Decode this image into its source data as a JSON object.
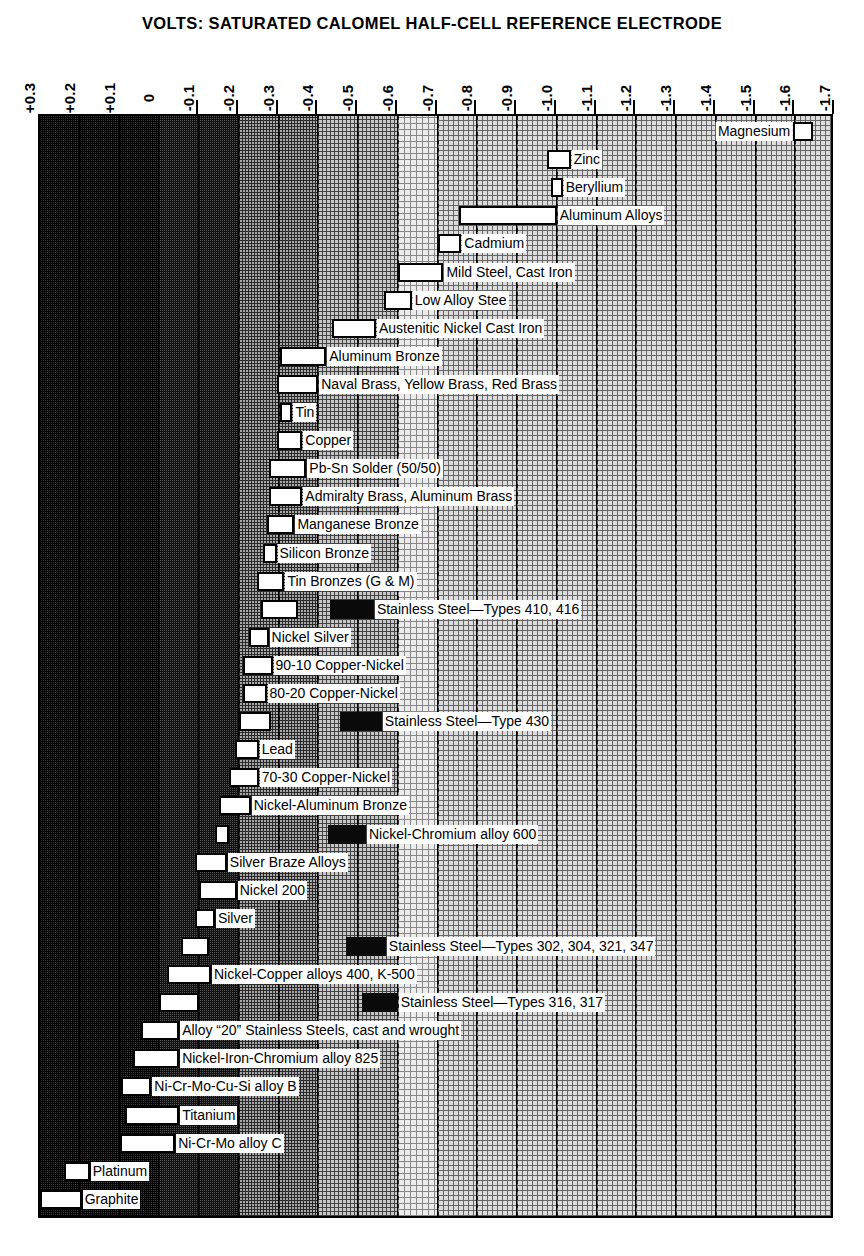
{
  "title": "VOLTS: SATURATED CALOMEL HALF-CELL REFERENCE ELECTRODE",
  "axis": {
    "ticks": [
      {
        "label": "+0.3",
        "value": 0.3,
        "mark": false
      },
      {
        "label": "+0.2",
        "value": 0.2,
        "mark": false
      },
      {
        "label": "+0.1",
        "value": 0.1,
        "mark": false
      },
      {
        "label": "0",
        "value": 0.0,
        "mark": false
      },
      {
        "label": "-0.1",
        "value": -0.1,
        "mark": true
      },
      {
        "label": "-0.2",
        "value": -0.2,
        "mark": true
      },
      {
        "label": "-0.3",
        "value": -0.3,
        "mark": true
      },
      {
        "label": "-0.4",
        "value": -0.4,
        "mark": true
      },
      {
        "label": "-0.5",
        "value": -0.5,
        "mark": true
      },
      {
        "label": "-0.6",
        "value": -0.6,
        "mark": true
      },
      {
        "label": "-0.7",
        "value": -0.7,
        "mark": true
      },
      {
        "label": "-0.8",
        "value": -0.8,
        "mark": true
      },
      {
        "label": "-0.9",
        "value": -0.9,
        "mark": true
      },
      {
        "label": "-1.0",
        "value": -1.0,
        "mark": true
      },
      {
        "label": "-1.1",
        "value": -1.1,
        "mark": true
      },
      {
        "label": "-1.2",
        "value": -1.2,
        "mark": true
      },
      {
        "label": "-1.3",
        "value": -1.3,
        "mark": true
      },
      {
        "label": "-1.4",
        "value": -1.4,
        "mark": true
      },
      {
        "label": "-1.5",
        "value": -1.5,
        "mark": true
      },
      {
        "label": "-1.6",
        "value": -1.6,
        "mark": true
      },
      {
        "label": "-1.7",
        "value": -1.7,
        "mark": true
      }
    ],
    "min": 0.3,
    "max": -1.7
  },
  "chart_data": {
    "type": "bar",
    "title": "VOLTS: SATURATED CALOMEL HALF-CELL REFERENCE ELECTRODE",
    "subtitle": "Galvanic series of metals and alloys in seawater",
    "xlabel": "Volts vs. saturated calomel half-cell reference electrode",
    "ylabel": "",
    "orientation": "horizontal-range",
    "xlim": [
      0.3,
      -1.7
    ],
    "grid": true,
    "legend": null,
    "note": "Each row is a potential RANGE (low..high in volts, negative = more anodic). White bars = normal behaviour; black bars = potential range exhibited in low-velocity or poorly aerated water, and at shielded areas.",
    "categories": [
      "Magnesium",
      "Zinc",
      "Beryllium",
      "Aluminum Alloys",
      "Cadmium",
      "Mild Steel, Cast Iron",
      "Low Alloy Stee",
      "Austenitic Nickel Cast Iron",
      "Aluminum Bronze",
      "Naval Brass, Yellow Brass, Red Brass",
      "Tin",
      "Copper",
      "Pb-Sn Solder (50/50)",
      "Admiralty Brass, Aluminum Brass",
      "Manganese Bronze",
      "Silicon Bronze",
      "Tin Bronzes (G & M)",
      "Stainless Steel—Types 410, 416",
      "Nickel Silver",
      "90-10 Copper-Nickel",
      "80-20 Copper-Nickel",
      "Stainless Steel—Type 430",
      "Lead",
      "70-30 Copper-Nickel",
      "Nickel-Aluminum Bronze",
      "Nickel-Chromium alloy 600",
      "Silver Braze Alloys",
      "Nickel 200",
      "Silver",
      "Stainless Steel—Types 302, 304, 321, 347",
      "Nickel-Copper alloys 400, K-500",
      "Stainless Steel—Types 316, 317",
      "Alloy “20” Stainless Steels, cast and wrought",
      "Nickel-Iron-Chromium alloy 825",
      "Ni-Cr-Mo-Cu-Si alloy B",
      "Titanium",
      "Ni-Cr-Mo alloy C",
      "Platinum",
      "Graphite"
    ],
    "series": [
      {
        "name": "Potential range (volts)",
        "type": "range",
        "ranges": [
          [
            -1.6,
            -1.63
          ],
          [
            -0.98,
            -1.03
          ],
          [
            -0.98,
            -1.01
          ],
          [
            -0.76,
            -1.0
          ],
          [
            -0.7,
            -0.76
          ],
          [
            -0.6,
            -0.71
          ],
          [
            -0.57,
            -0.63
          ],
          [
            -0.44,
            -0.54
          ],
          [
            -0.31,
            -0.42
          ],
          [
            -0.3,
            -0.4
          ],
          [
            -0.31,
            -0.33
          ],
          [
            -0.3,
            -0.36
          ],
          [
            -0.28,
            -0.37
          ],
          [
            -0.28,
            -0.36
          ],
          [
            -0.27,
            -0.34
          ],
          [
            -0.26,
            -0.29
          ],
          [
            -0.24,
            -0.31
          ],
          [
            -0.26,
            -0.35
          ],
          [
            -0.22,
            -0.27
          ],
          [
            -0.21,
            -0.28
          ],
          [
            -0.21,
            -0.27
          ],
          [
            -0.2,
            -0.28
          ],
          [
            -0.19,
            -0.25
          ],
          [
            -0.18,
            -0.25
          ],
          [
            -0.15,
            -0.23
          ],
          [
            -0.14,
            -0.17
          ],
          [
            -0.09,
            -0.17
          ],
          [
            -0.1,
            -0.2
          ],
          [
            -0.09,
            -0.14
          ],
          [
            -0.05,
            -0.13
          ],
          [
            -0.02,
            -0.13
          ],
          [
            0.0,
            -0.1
          ],
          [
            0.05,
            -0.05
          ],
          [
            0.07,
            -0.05
          ],
          [
            0.1,
            -0.02
          ],
          [
            0.09,
            -0.05
          ],
          [
            0.1,
            -0.04
          ],
          [
            0.24,
            0.18
          ],
          [
            0.3,
            0.2
          ]
        ]
      },
      {
        "name": "Low-velocity / poorly aerated / shielded (black bars)",
        "type": "range",
        "ranges": [
          null,
          null,
          null,
          null,
          null,
          null,
          null,
          null,
          null,
          null,
          null,
          null,
          null,
          null,
          null,
          null,
          null,
          [
            -0.43,
            -0.54
          ],
          null,
          null,
          null,
          [
            -0.46,
            -0.56
          ],
          null,
          null,
          null,
          [
            -0.43,
            -0.52
          ],
          null,
          null,
          null,
          [
            -0.47,
            -0.57
          ],
          null,
          [
            -0.51,
            -0.6
          ],
          null,
          null,
          null,
          null,
          null,
          null,
          null
        ]
      }
    ]
  },
  "rows": [
    {
      "label": "Magnesium",
      "lo": -1.595,
      "hi": -1.645,
      "side": "left",
      "black": null
    },
    {
      "label": "Zinc",
      "lo": -0.975,
      "hi": -1.035,
      "side": "right",
      "black": null
    },
    {
      "label": "Beryllium",
      "lo": -0.985,
      "hi": -1.015,
      "side": "right",
      "black": null
    },
    {
      "label": "Aluminum Alloys",
      "lo": -0.755,
      "hi": -1.0,
      "side": "right",
      "black": null
    },
    {
      "label": "Cadmium",
      "lo": -0.7,
      "hi": -0.76,
      "side": "right",
      "black": null
    },
    {
      "label": "Mild Steel, Cast Iron",
      "lo": -0.6,
      "hi": -0.715,
      "side": "right",
      "black": null
    },
    {
      "label": "Low Alloy Stee",
      "lo": -0.565,
      "hi": -0.635,
      "side": "right",
      "black": null
    },
    {
      "label": "Austenitic Nickel Cast Iron",
      "lo": -0.435,
      "hi": -0.545,
      "side": "right",
      "black": null
    },
    {
      "label": "Aluminum Bronze",
      "lo": -0.305,
      "hi": -0.42,
      "side": "right",
      "black": null
    },
    {
      "label": "Naval Brass, Yellow Brass, Red Brass",
      "lo": -0.295,
      "hi": -0.4,
      "side": "right",
      "black": null
    },
    {
      "label": "Tin",
      "lo": -0.305,
      "hi": -0.335,
      "side": "right",
      "black": null
    },
    {
      "label": "Copper",
      "lo": -0.295,
      "hi": -0.36,
      "side": "right",
      "black": null
    },
    {
      "label": "Pb-Sn Solder (50/50)",
      "lo": -0.275,
      "hi": -0.37,
      "side": "right",
      "black": null
    },
    {
      "label": "Admiralty Brass, Aluminum Brass",
      "lo": -0.275,
      "hi": -0.36,
      "side": "right",
      "black": null
    },
    {
      "label": "Manganese Bronze",
      "lo": -0.27,
      "hi": -0.34,
      "side": "right",
      "black": null
    },
    {
      "label": "Silicon Bronze",
      "lo": -0.26,
      "hi": -0.295,
      "side": "right",
      "black": null
    },
    {
      "label": "Tin Bronzes (G & M)",
      "lo": -0.245,
      "hi": -0.315,
      "side": "right",
      "black": null
    },
    {
      "label": "Stainless Steel—Types 410, 416",
      "lo": -0.255,
      "hi": -0.35,
      "side": "right",
      "black": [
        -0.43,
        -0.54
      ]
    },
    {
      "label": "Nickel Silver",
      "lo": -0.225,
      "hi": -0.275,
      "side": "right",
      "black": null
    },
    {
      "label": "90-10 Copper-Nickel",
      "lo": -0.21,
      "hi": -0.285,
      "side": "right",
      "black": null
    },
    {
      "label": "80-20 Copper-Nickel",
      "lo": -0.21,
      "hi": -0.27,
      "side": "right",
      "black": null
    },
    {
      "label": "Stainless Steel—Type 430",
      "lo": -0.2,
      "hi": -0.28,
      "side": "right",
      "black": [
        -0.455,
        -0.56
      ]
    },
    {
      "label": "Lead",
      "lo": -0.19,
      "hi": -0.25,
      "side": "right",
      "black": null
    },
    {
      "label": "70-30 Copper-Nickel",
      "lo": -0.175,
      "hi": -0.25,
      "side": "right",
      "black": null
    },
    {
      "label": "Nickel-Aluminum Bronze",
      "lo": -0.15,
      "hi": -0.23,
      "side": "right",
      "black": null
    },
    {
      "label": "Nickel-Chromium alloy 600",
      "lo": -0.14,
      "hi": -0.175,
      "side": "right",
      "black": [
        -0.425,
        -0.52
      ]
    },
    {
      "label": "Silver Braze Alloys",
      "lo": -0.09,
      "hi": -0.17,
      "side": "right",
      "black": null
    },
    {
      "label": "Nickel 200",
      "lo": -0.1,
      "hi": -0.195,
      "side": "right",
      "black": null
    },
    {
      "label": "Silver",
      "lo": -0.09,
      "hi": -0.14,
      "side": "right",
      "black": null
    },
    {
      "label": "Stainless Steel—Types 302, 304, 321, 347",
      "lo": -0.055,
      "hi": -0.125,
      "side": "right",
      "black": [
        -0.47,
        -0.57
      ]
    },
    {
      "label": "Nickel-Copper alloys 400, K-500",
      "lo": -0.02,
      "hi": -0.13,
      "side": "right",
      "black": null
    },
    {
      "label": "Stainless Steel—Types 316, 317",
      "lo": 0.0,
      "hi": -0.1,
      "side": "right",
      "black": [
        -0.51,
        -0.6
      ]
    },
    {
      "label": "Alloy “20” Stainless Steels, cast and wrought",
      "lo": 0.045,
      "hi": -0.05,
      "side": "right",
      "black": null
    },
    {
      "label": "Nickel-Iron-Chromium alloy 825",
      "lo": 0.065,
      "hi": -0.05,
      "side": "right",
      "black": null
    },
    {
      "label": "Ni-Cr-Mo-Cu-Si alloy B",
      "lo": 0.095,
      "hi": 0.02,
      "side": "right",
      "black": null
    },
    {
      "label": "Titanium",
      "lo": 0.085,
      "hi": -0.05,
      "side": "right",
      "black": null
    },
    {
      "label": "Ni-Cr-Mo alloy C",
      "lo": 0.1,
      "hi": -0.04,
      "side": "right",
      "black": null
    },
    {
      "label": "Platinum",
      "lo": 0.24,
      "hi": 0.175,
      "side": "right",
      "black": null
    },
    {
      "label": "Graphite",
      "lo": 0.3,
      "hi": 0.195,
      "side": "right",
      "black": null
    }
  ],
  "bands": [
    {
      "from": 0.3,
      "to": 0.2,
      "shade": "d1"
    },
    {
      "from": 0.2,
      "to": 0.1,
      "shade": "d1"
    },
    {
      "from": 0.1,
      "to": 0.0,
      "shade": "d1"
    },
    {
      "from": 0.0,
      "to": -0.1,
      "shade": "d2"
    },
    {
      "from": -0.1,
      "to": -0.2,
      "shade": "d2"
    },
    {
      "from": -0.2,
      "to": -0.3,
      "shade": "d4"
    },
    {
      "from": -0.3,
      "to": -0.4,
      "shade": "d4"
    },
    {
      "from": -0.4,
      "to": -0.5,
      "shade": "d5"
    },
    {
      "from": -0.5,
      "to": -0.6,
      "shade": "d5"
    },
    {
      "from": -0.6,
      "to": -0.7,
      "shade": "d7"
    },
    {
      "from": -0.7,
      "to": -0.8,
      "shade": "d6"
    },
    {
      "from": -0.8,
      "to": -0.9,
      "shade": "d6"
    },
    {
      "from": -0.9,
      "to": -1.0,
      "shade": "d6"
    },
    {
      "from": -1.0,
      "to": -1.1,
      "shade": "d6"
    },
    {
      "from": -1.1,
      "to": -1.2,
      "shade": "d6"
    },
    {
      "from": -1.2,
      "to": -1.3,
      "shade": "d6"
    },
    {
      "from": -1.3,
      "to": -1.4,
      "shade": "d6"
    },
    {
      "from": -1.4,
      "to": -1.5,
      "shade": "d6"
    },
    {
      "from": -1.5,
      "to": -1.6,
      "shade": "d6"
    },
    {
      "from": -1.6,
      "to": -1.7,
      "shade": "d6"
    }
  ]
}
